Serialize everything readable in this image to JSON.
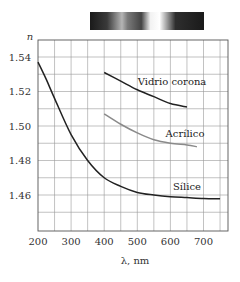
{
  "chart_data": {
    "type": "line",
    "title": "",
    "xlabel": "λ, nm",
    "ylabel": "n",
    "xlim": [
      200,
      780
    ],
    "ylim": [
      1.45,
      1.55
    ],
    "grid": true,
    "x_ticks": [
      200,
      300,
      400,
      500,
      600,
      700
    ],
    "y_ticks": [
      1.46,
      1.48,
      1.5,
      1.52,
      1.54
    ],
    "x_tick_labels": [
      "200",
      "300",
      "400",
      "500",
      "600",
      "700"
    ],
    "y_tick_labels": [
      "1.46",
      "1.48",
      "1.50",
      "1.52",
      "1.54"
    ],
    "series": [
      {
        "name": "Vidrio corona",
        "color": "#222222",
        "x": [
          400,
          450,
          500,
          550,
          600,
          650
        ],
        "y": [
          1.531,
          1.526,
          1.521,
          1.517,
          1.513,
          1.511
        ]
      },
      {
        "name": "Acrílico",
        "color": "#8a8a8a",
        "x": [
          400,
          450,
          500,
          550,
          600,
          650,
          680
        ],
        "y": [
          1.507,
          1.501,
          1.496,
          1.492,
          1.49,
          1.489,
          1.488
        ]
      },
      {
        "name": "Sílice",
        "color": "#222222",
        "x": [
          200,
          225,
          250,
          300,
          350,
          400,
          450,
          500,
          550,
          600,
          650,
          700,
          750
        ],
        "y": [
          1.537,
          1.527,
          1.516,
          1.495,
          1.48,
          1.47,
          1.465,
          1.4615,
          1.46,
          1.459,
          1.4585,
          1.458,
          1.4578
        ]
      }
    ],
    "annotations": [
      {
        "text": "Vidrio corona",
        "x": 600,
        "y": 1.52
      },
      {
        "text": "Acrílico",
        "x": 650,
        "y": 1.496
      },
      {
        "text": "Sílice",
        "x": 650,
        "y": 1.465
      }
    ],
    "spectrum_bar": {
      "description": "visible spectrum strip above the plot (grayscale)"
    }
  },
  "labels": {
    "y_axis": "n",
    "x_axis": "λ, nm",
    "vidrio": "Vidrio corona",
    "acrilico": "Acrílico",
    "silice": "Sílice"
  }
}
